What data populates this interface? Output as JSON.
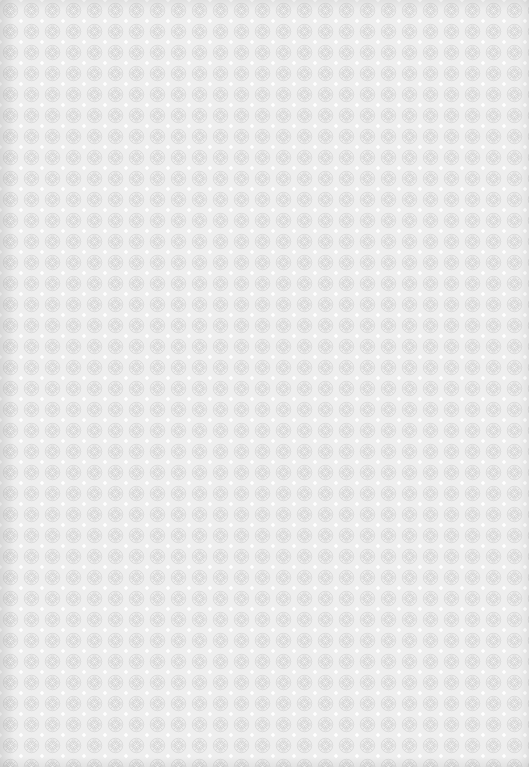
{
  "image": {
    "kind": "seamless texture",
    "description": "Light gray repeating geometric rosette / lace pattern",
    "tile_size_px": 21,
    "colors": {
      "background": "#eeeeee",
      "motif_line": "#d2d2d2",
      "highlight": "#ffffff",
      "edge_shadow": "#cfcfcf"
    }
  }
}
